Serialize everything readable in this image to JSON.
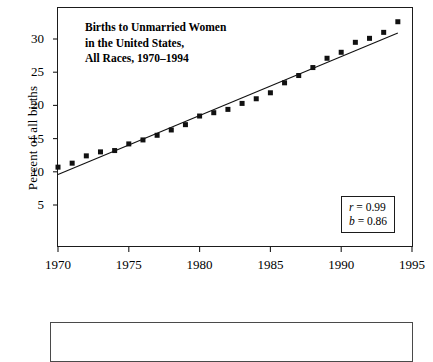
{
  "chart_data": {
    "type": "scatter",
    "title": "Births to Unmarried Women in the United States, All Races, 1970–1994",
    "title_lines": [
      "Births to Unmarried Women",
      "in the United States,",
      "All Races, 1970–1994"
    ],
    "xlabel": "",
    "ylabel": "Percent of all births",
    "xlim": [
      1970,
      1995
    ],
    "ylim": [
      0,
      33.5
    ],
    "xticks": [
      1970,
      1975,
      1980,
      1985,
      1990,
      1995
    ],
    "xtick_labels": [
      "1970",
      "1975",
      "1980",
      "1985",
      "1990",
      "1995"
    ],
    "yticks": [
      5,
      10,
      15,
      20,
      25,
      30
    ],
    "ytick_labels": [
      "5",
      "10",
      "15",
      "20",
      "25",
      "30"
    ],
    "grid": false,
    "legend": null,
    "x": [
      1970,
      1971,
      1972,
      1973,
      1974,
      1975,
      1976,
      1977,
      1978,
      1979,
      1980,
      1981,
      1982,
      1983,
      1984,
      1985,
      1986,
      1987,
      1988,
      1989,
      1990,
      1991,
      1992,
      1993,
      1994
    ],
    "values": [
      10.7,
      11.3,
      12.4,
      13.0,
      13.2,
      14.2,
      14.8,
      15.5,
      16.3,
      17.1,
      18.4,
      18.9,
      19.4,
      20.3,
      21.0,
      21.9,
      23.4,
      24.5,
      25.7,
      27.1,
      28.0,
      29.5,
      30.1,
      31.0,
      32.6
    ],
    "series": [
      {
        "name": "Percent of births to unmarried women",
        "marker": "filled-square",
        "color": "#111111",
        "values": [
          10.7,
          11.3,
          12.4,
          13.0,
          13.2,
          14.2,
          14.8,
          15.5,
          16.3,
          17.1,
          18.4,
          18.9,
          19.4,
          20.3,
          21.0,
          21.9,
          23.4,
          24.5,
          25.7,
          27.1,
          28.0,
          29.5,
          30.1,
          31.0,
          32.6
        ]
      }
    ],
    "fit_line": {
      "type": "linear-regression",
      "slope": 0.86,
      "x_start": 1970,
      "y_start": 9.6,
      "x_end": 1994,
      "y_end": 30.9,
      "color": "#111111"
    },
    "annotations": {
      "r_label": "r",
      "r_value": "= 0.99",
      "b_label": "b",
      "b_value": "= 0.86"
    }
  },
  "stats": {
    "r_label": "r",
    "r_value": "= 0.99",
    "b_label": "b",
    "b_value": "= 0.86"
  },
  "caption": {
    "text": ""
  }
}
